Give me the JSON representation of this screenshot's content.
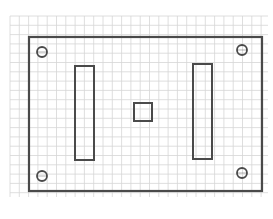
{
  "diagram": {
    "type": "technical-sketch",
    "colors": {
      "background": "#ffffff",
      "grid_line": "#d6d6d6",
      "outline": "#4a4a4a"
    },
    "grid": {
      "x0": 10,
      "y0": 16,
      "x1": 268,
      "y1": 197,
      "spacing": 9.3
    },
    "plate": {
      "x": 29,
      "y": 37,
      "width": 233,
      "height": 154
    },
    "holes": [
      {
        "name": "top-left",
        "cx": 42,
        "cy": 52,
        "r": 5
      },
      {
        "name": "top-right",
        "cx": 242,
        "cy": 50,
        "r": 5
      },
      {
        "name": "bottom-left",
        "cx": 42,
        "cy": 176,
        "r": 5
      },
      {
        "name": "bottom-right",
        "cx": 242,
        "cy": 173,
        "r": 5
      }
    ],
    "slots": [
      {
        "name": "left",
        "x": 75,
        "y": 66,
        "width": 19,
        "height": 94
      },
      {
        "name": "right",
        "x": 193,
        "y": 64,
        "width": 19,
        "height": 95
      }
    ],
    "center_square": {
      "x": 134,
      "y": 103,
      "width": 18,
      "height": 18
    }
  }
}
